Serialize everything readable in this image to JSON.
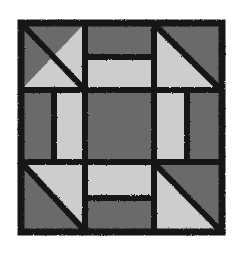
{
  "artwork": {
    "title": "Quilt Block Pattern",
    "kind": "quilt-block-diagram",
    "description": "Three-by-three patchwork quilt block with half-square-triangle corners, split bar edges, and a solid dark center square",
    "caption": "",
    "background_color": "#ffffff",
    "ink_color": "#000000"
  },
  "palette": {
    "dark_fabric": "#6b6b6b",
    "light_fabric": "#cdcdcd",
    "outline": "#141414",
    "page_background": "#ffffff"
  },
  "geometry": {
    "block_left": 17,
    "block_top": 19,
    "block_width": 209,
    "block_height": 217,
    "grid_columns": 3,
    "grid_rows": 3,
    "vertical_grid_lines": [
      68,
      137
    ],
    "horizontal_grid_lines": [
      71,
      143
    ],
    "outer_border_thickness": 7,
    "inner_line_thickness": 6
  },
  "cells": [
    {
      "position": "top-left",
      "row": 0,
      "col": 0,
      "type": "half-square-triangle",
      "diagonal": "top-left-to-bottom-right",
      "upper_fill": "#6b6b6b",
      "lower_fill": "#cdcdcd"
    },
    {
      "position": "top-center",
      "row": 0,
      "col": 1,
      "type": "split-horizontal",
      "top_fill": "#6b6b6b",
      "bottom_fill": "#cdcdcd",
      "split_ratio": 0.5
    },
    {
      "position": "top-right",
      "row": 0,
      "col": 2,
      "type": "half-square-triangle",
      "diagonal": "top-right-to-bottom-left",
      "upper_fill": "#6b6b6b",
      "lower_fill": "#cdcdcd"
    },
    {
      "position": "middle-left",
      "row": 1,
      "col": 0,
      "type": "split-vertical",
      "left_fill": "#6b6b6b",
      "right_fill": "#cdcdcd",
      "split_ratio": 0.5
    },
    {
      "position": "center",
      "row": 1,
      "col": 1,
      "type": "solid",
      "fill": "#6b6b6b"
    },
    {
      "position": "middle-right",
      "row": 1,
      "col": 2,
      "type": "split-vertical",
      "left_fill": "#cdcdcd",
      "right_fill": "#6b6b6b",
      "split_ratio": 0.5
    },
    {
      "position": "bottom-left",
      "row": 2,
      "col": 0,
      "type": "half-square-triangle",
      "diagonal": "top-right-to-bottom-left",
      "upper_fill": "#cdcdcd",
      "lower_fill": "#6b6b6b"
    },
    {
      "position": "bottom-center",
      "row": 2,
      "col": 1,
      "type": "split-horizontal",
      "top_fill": "#cdcdcd",
      "bottom_fill": "#6b6b6b",
      "split_ratio": 0.5
    },
    {
      "position": "bottom-right",
      "row": 2,
      "col": 2,
      "type": "half-square-triangle",
      "diagonal": "top-left-to-bottom-right",
      "upper_fill": "#6b6b6b",
      "lower_fill": "#cdcdcd"
    }
  ]
}
